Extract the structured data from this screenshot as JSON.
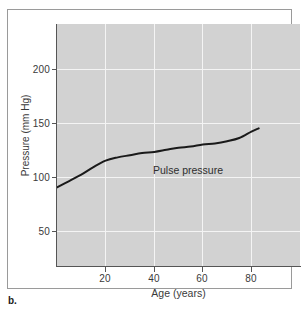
{
  "figure": {
    "panel_caption": "b.",
    "background_color": "#ffffff",
    "frame_color": "#9a9a9a"
  },
  "chart_data": {
    "type": "line",
    "title": "",
    "subtitle": "",
    "xlabel": "Age (years)",
    "ylabel": "Pressure (mm Hg)",
    "xlim": [
      0,
      100
    ],
    "ylim": [
      0,
      225
    ],
    "grid": true,
    "grid_color": "#f4f4f4",
    "plot_background": "#d2d2d2",
    "legend_position": "inline-annotation",
    "xticks": [
      20,
      40,
      60,
      80
    ],
    "xtick_labels": [
      "20",
      "40",
      "60",
      "80"
    ],
    "yticks": [
      50,
      100,
      150,
      200
    ],
    "ytick_labels": [
      "50",
      "100",
      "150",
      "200"
    ],
    "series": [
      {
        "name": "Pulse pressure",
        "annotation": "Pulse pressure",
        "color": "#1a1a1a",
        "line_width": 2,
        "x": [
          0,
          5,
          10,
          15,
          20,
          25,
          30,
          35,
          40,
          45,
          50,
          55,
          60,
          65,
          70,
          75,
          80,
          83
        ],
        "values": [
          73,
          79,
          85,
          92,
          98,
          101,
          103,
          105,
          106,
          108,
          110,
          111,
          113,
          114,
          116,
          119,
          125,
          128
        ]
      }
    ]
  }
}
